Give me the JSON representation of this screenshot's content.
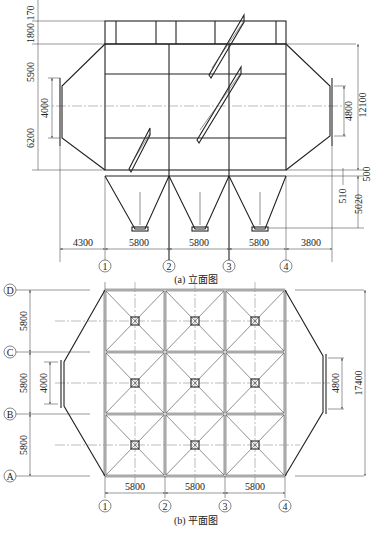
{
  "elevation": {
    "caption": "(a) 立面图",
    "left_dims": [
      "170",
      "1800",
      "5900",
      "4000",
      "6200"
    ],
    "right_dims": [
      "4800",
      "12100",
      "500",
      "510",
      "5020"
    ],
    "bottom_dims": [
      "4300",
      "5800",
      "5800",
      "5800",
      "3800"
    ],
    "axis_labels": [
      "1",
      "2",
      "3",
      "4"
    ]
  },
  "plan": {
    "caption": "(b) 平面图",
    "row_labels": [
      "D",
      "C",
      "B",
      "A"
    ],
    "left_dims": [
      "5800",
      "5800",
      "5800"
    ],
    "inlet_dim": "4000",
    "outlet_dim": "4800",
    "total_dim": "17400",
    "bottom_dims": [
      "5800",
      "5800",
      "5800"
    ],
    "axis_labels": [
      "1",
      "2",
      "3",
      "4"
    ]
  }
}
